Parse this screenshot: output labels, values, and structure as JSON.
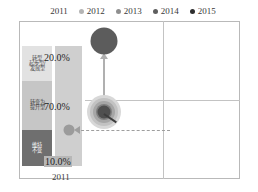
{
  "legend": {
    "items": [
      {
        "label": "2011",
        "color": "transparent",
        "has_dot": false
      },
      {
        "label": "2012",
        "color": "#b4b4b4",
        "has_dot": true
      },
      {
        "label": "2013",
        "color": "#8f8f8f",
        "has_dot": true
      },
      {
        "label": "2014",
        "color": "#5e5e5e",
        "has_dot": true
      },
      {
        "label": "2015",
        "color": "#2e2e2e",
        "has_dot": true
      }
    ]
  },
  "left_panel": {
    "segments": [
      {
        "label_lines": [
          "转型",
          "起步型/",
          "发展型"
        ],
        "value": "20.0%",
        "color": "#e2e2e2"
      },
      {
        "label_lines": [
          "转变为",
          "提升型"
        ],
        "value": "70.0%",
        "color": "#c6c6c6"
      },
      {
        "label_lines": [
          "维持",
          "不变"
        ],
        "value": "10.0%",
        "color": "#6f6f6f"
      }
    ],
    "axis_year": "2011"
  },
  "chart_data": {
    "type": "scatter",
    "title": "",
    "xlabel": "",
    "ylabel": "",
    "grid": true,
    "legend_position": "top",
    "quadrants": 4,
    "series": [
      {
        "name": "2011",
        "color": "#d8d8d8",
        "x": 0.5,
        "y": 0.42,
        "size": 34
      },
      {
        "name": "2012",
        "color": "#c2c2c2",
        "x": 0.5,
        "y": 0.42,
        "size": 28
      },
      {
        "name": "2013",
        "color": "#a6a6a6",
        "x": 0.5,
        "y": 0.42,
        "size": 22
      },
      {
        "name": "2014",
        "color": "#7e7e7e",
        "x": 0.5,
        "y": 0.42,
        "size": 16
      },
      {
        "name": "2015",
        "color": "#4f4f4f",
        "x": 0.5,
        "y": 0.42,
        "size": 13
      }
    ],
    "highlight_bubble": {
      "color": "#5c5c5c",
      "x": 0.5,
      "y": 0.87,
      "size": 27
    },
    "outlier_bubble": {
      "color": "#9b9b9b",
      "size": 11
    },
    "annotations": [
      {
        "type": "arrow",
        "direction": "up",
        "style": "solid"
      },
      {
        "type": "arrow",
        "direction": "left",
        "style": "dashed"
      }
    ]
  }
}
